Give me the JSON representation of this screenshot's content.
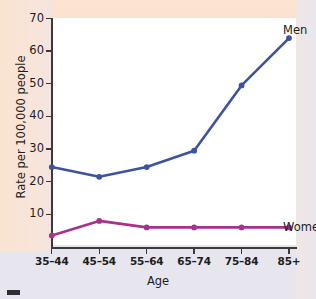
{
  "chart_data": {
    "type": "line",
    "title": "",
    "xlabel": "Age",
    "ylabel": "Rate per 100,000 people",
    "categories": [
      "35–44",
      "45–54",
      "55–64",
      "65–74",
      "75–84",
      "85+"
    ],
    "yticks": [
      10,
      20,
      30,
      40,
      50,
      60,
      70
    ],
    "ylim": [
      0,
      70
    ],
    "grid": false,
    "legend_position": "right-of-line-ends",
    "series": [
      {
        "name": "Men",
        "color": "#3d52a0",
        "values": [
          24.5,
          21.5,
          24.5,
          29.5,
          49.5,
          64.0
        ]
      },
      {
        "name": "Women",
        "color": "#a5328c",
        "values": [
          3.5,
          8.0,
          6.0,
          6.0,
          6.0,
          6.0
        ]
      }
    ],
    "annotations": [
      {
        "text": "Men",
        "series": "Men"
      },
      {
        "text": "Women",
        "series": "Women"
      }
    ]
  },
  "colors": {
    "men_line": "#3d52a0",
    "women_line": "#a5328c",
    "axis": "#3a3a3a",
    "panel_background": "#ffffff",
    "page_background_top": "#fbe3ce",
    "page_background_bottom": "#e7e5ed",
    "text": "#1d1d1d"
  }
}
